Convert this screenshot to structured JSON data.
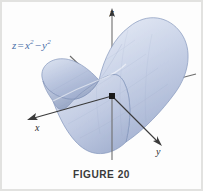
{
  "figure": {
    "caption": "FIGURE 20",
    "equation": {
      "lhs": "z",
      "equals": "=",
      "term1_base": "x",
      "term1_exp": "2",
      "operator": "−",
      "term2_base": "y",
      "term2_exp": "2",
      "plain": "z = x² − y²"
    },
    "axes": {
      "x_label": "x",
      "y_label": "y",
      "z_label": "z"
    },
    "colors": {
      "equation_text": "#4a6fa8",
      "axis_line": "#3a3a3a",
      "caption_text": "#3a3a3a",
      "surface_light": "#eef1f8",
      "surface_mid": "#c3cde4",
      "surface_dark": "#97a8c9",
      "surface_edge": "#7d90b5",
      "background": "#fdfdfd",
      "origin_marker": "#1a1a1a"
    }
  }
}
